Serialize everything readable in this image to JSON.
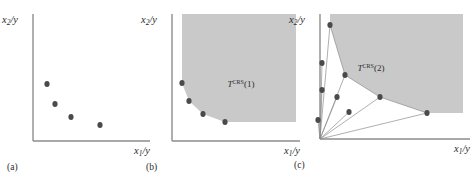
{
  "figure": {
    "type": "multi-panel-scatter",
    "width": 476,
    "height": 180,
    "background": "#ffffff",
    "colors": {
      "point_fill": "#4a4a4a",
      "region_fill": "#c9c9c9",
      "axis": "#8d8d8d",
      "ray": "#8d8d8d",
      "text": "#2b2b2b"
    }
  },
  "axes_labels": {
    "y_main": "x",
    "y_sub": "2",
    "y_tail": "/y",
    "x_main": "x",
    "x_sub": "1",
    "x_tail": "/y"
  },
  "panels": [
    {
      "id": "a",
      "caption": "(a)",
      "ylabel": "x₂/y",
      "xlabel": "x₁/y",
      "region_label": "",
      "has_region": false,
      "has_rays": false
    },
    {
      "id": "b",
      "caption": "(b)",
      "ylabel": "x₂/y",
      "xlabel": "x₁/y",
      "region_label_base": "T",
      "region_label_sup": "CRS",
      "region_label_arg": "(1)",
      "has_region": true,
      "has_rays": false
    },
    {
      "id": "c",
      "caption": "(c)",
      "ylabel": "x₂/y",
      "xlabel": "x₁/y",
      "region_label_base": "T",
      "region_label_sup": "CRS",
      "region_label_arg": "(2)",
      "has_region": true,
      "has_rays": true
    }
  ],
  "chart_data": {
    "type": "scatter",
    "title": "",
    "xlabel": "x1/y",
    "ylabel": "x2/y",
    "grid": false,
    "legend": "none",
    "panels": [
      {
        "id": "a",
        "caption": "(a)",
        "description": "Four observed input-ratio points, no technology set drawn.",
        "points": [
          {
            "x": 47,
            "y": 84,
            "efficient": true
          },
          {
            "x": 55,
            "y": 104,
            "efficient": true
          },
          {
            "x": 71,
            "y": 117,
            "efficient": true
          },
          {
            "x": 100,
            "y": 125,
            "efficient": true
          }
        ],
        "axis": {
          "x0": 33,
          "y0": 141,
          "x1": 150,
          "y1": 14
        }
      },
      {
        "id": "b",
        "caption": "(b)",
        "description": "CRS technology set T-CRS(1): free-disposal hull to the upper right of the piecewise-linear frontier through all four points.",
        "label": "T^CRS(1)",
        "label_pos": {
          "x": 241,
          "y": 87
        },
        "points": [
          {
            "x": 182,
            "y": 83,
            "efficient": true
          },
          {
            "x": 189,
            "y": 101,
            "efficient": true
          },
          {
            "x": 203,
            "y": 114,
            "efficient": true
          },
          {
            "x": 225,
            "y": 122,
            "efficient": true
          }
        ],
        "region_polygon": [
          [
            182,
            83
          ],
          [
            189,
            101
          ],
          [
            203,
            114
          ],
          [
            225,
            122
          ],
          [
            296,
            122
          ],
          [
            296,
            14
          ],
          [
            182,
            14
          ]
        ],
        "axis": {
          "x0": 172,
          "y0": 141,
          "x1": 300,
          "y1": 14
        }
      },
      {
        "id": "c",
        "caption": "(c)",
        "description": "CRS technology set T-CRS(2): frontier spanned by three efficient points with rays from the origin through each observation; interior points are inefficient.",
        "label": "T^CRS(2)",
        "label_pos": {
          "x": 371,
          "y": 71
        },
        "origin": {
          "x": 320,
          "y": 139
        },
        "points": [
          {
            "x": 330,
            "y": 25,
            "efficient": true
          },
          {
            "x": 322,
            "y": 63,
            "efficient": false
          },
          {
            "x": 345,
            "y": 75,
            "efficient": true
          },
          {
            "x": 322,
            "y": 90,
            "efficient": false
          },
          {
            "x": 337,
            "y": 97,
            "efficient": false
          },
          {
            "x": 380,
            "y": 97,
            "efficient": true
          },
          {
            "x": 349,
            "y": 112,
            "efficient": false
          },
          {
            "x": 427,
            "y": 113,
            "efficient": true
          },
          {
            "x": 318,
            "y": 120,
            "efficient": false
          }
        ],
        "rays": [
          [
            [
              320,
              139
            ],
            [
              330,
              25
            ]
          ],
          [
            [
              320,
              139
            ],
            [
              322,
              63
            ]
          ],
          [
            [
              320,
              139
            ],
            [
              345,
              75
            ]
          ],
          [
            [
              320,
              139
            ],
            [
              322,
              90
            ]
          ],
          [
            [
              320,
              139
            ],
            [
              337,
              97
            ]
          ],
          [
            [
              320,
              139
            ],
            [
              380,
              97
            ]
          ],
          [
            [
              320,
              139
            ],
            [
              349,
              112
            ]
          ],
          [
            [
              320,
              139
            ],
            [
              427,
              113
            ]
          ],
          [
            [
              320,
              139
            ],
            [
              318,
              120
            ]
          ]
        ],
        "region_polygon": [
          [
            330,
            25
          ],
          [
            345,
            75
          ],
          [
            380,
            97
          ],
          [
            427,
            113
          ],
          [
            463,
            113
          ],
          [
            463,
            14
          ],
          [
            330,
            14
          ]
        ],
        "axis": {
          "x0": 320,
          "y0": 139,
          "x1": 470,
          "y1": 14
        }
      }
    ]
  }
}
